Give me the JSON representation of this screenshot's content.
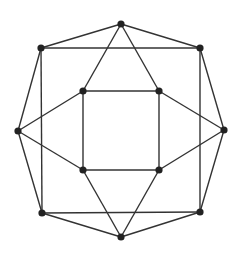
{
  "diagram": {
    "type": "graph",
    "colors": {
      "edge": "#333333",
      "node": "#222222",
      "background": "#ffffff"
    },
    "nodes": [
      {
        "id": "top",
        "x": 121,
        "y": 24
      },
      {
        "id": "outer-tl",
        "x": 41,
        "y": 48
      },
      {
        "id": "outer-tr",
        "x": 200,
        "y": 48
      },
      {
        "id": "left",
        "x": 18,
        "y": 131
      },
      {
        "id": "right",
        "x": 224,
        "y": 130
      },
      {
        "id": "outer-bl",
        "x": 42,
        "y": 213
      },
      {
        "id": "outer-br",
        "x": 200,
        "y": 212
      },
      {
        "id": "bottom",
        "x": 121,
        "y": 237
      },
      {
        "id": "inner-tl",
        "x": 83,
        "y": 91
      },
      {
        "id": "inner-tr",
        "x": 159,
        "y": 91
      },
      {
        "id": "inner-bl",
        "x": 83,
        "y": 170
      },
      {
        "id": "inner-br",
        "x": 159,
        "y": 170
      }
    ],
    "edges": [
      [
        "top",
        "outer-tl"
      ],
      [
        "top",
        "outer-tr"
      ],
      [
        "outer-tl",
        "outer-tr"
      ],
      [
        "top",
        "inner-tl"
      ],
      [
        "top",
        "inner-tr"
      ],
      [
        "inner-tl",
        "inner-tr"
      ],
      [
        "outer-tl",
        "outer-bl"
      ],
      [
        "outer-tr",
        "outer-br"
      ],
      [
        "outer-tl",
        "left"
      ],
      [
        "outer-tr",
        "right"
      ],
      [
        "inner-tl",
        "left"
      ],
      [
        "inner-tr",
        "right"
      ],
      [
        "inner-tl",
        "inner-bl"
      ],
      [
        "inner-tr",
        "inner-br"
      ],
      [
        "left",
        "inner-bl"
      ],
      [
        "right",
        "inner-br"
      ],
      [
        "left",
        "outer-bl"
      ],
      [
        "right",
        "outer-br"
      ],
      [
        "inner-bl",
        "inner-br"
      ],
      [
        "inner-bl",
        "bottom"
      ],
      [
        "inner-br",
        "bottom"
      ],
      [
        "outer-bl",
        "outer-br"
      ],
      [
        "outer-bl",
        "bottom"
      ],
      [
        "outer-br",
        "bottom"
      ]
    ]
  }
}
